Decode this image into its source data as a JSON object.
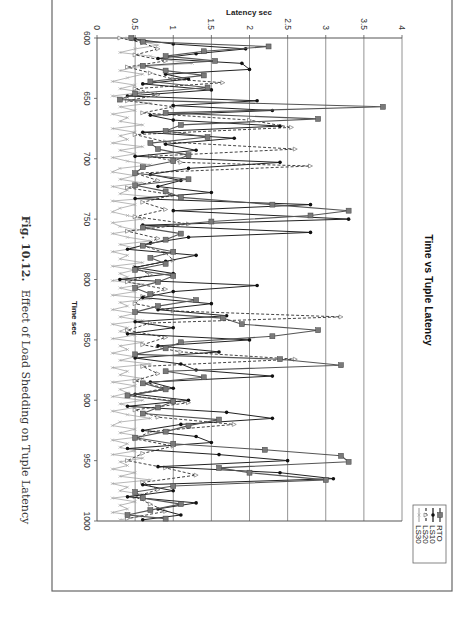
{
  "caption": {
    "label": "Fig. 10.12.",
    "text": "Effect of Load Shedding on Tuple Latency"
  },
  "chart_data": {
    "type": "line",
    "orientation": "rotated-90-clockwise",
    "title": "Time vs Tuple Latency",
    "xlabel": "Time sec",
    "ylabel": "Latency sec",
    "xlim": [
      600,
      1000
    ],
    "ylim": [
      0,
      4
    ],
    "x_ticks": [
      "600",
      "650",
      "700",
      "750",
      "800",
      "850",
      "900",
      "950",
      "1000"
    ],
    "y_ticks": [
      "0",
      "0.5",
      "1",
      "1.5",
      "2",
      "2.5",
      "3",
      "3.5",
      "4"
    ],
    "grid": "major gridlines on latency axis",
    "legend_position": "right (bottom-right when rotated)",
    "legend": [
      "RTO",
      "LS10",
      "LS20",
      "LS30"
    ],
    "series": [
      {
        "name": "RTO",
        "style": "solid, square markers",
        "color": "#555555",
        "x": [
          600,
          603,
          607,
          611,
          615,
          619,
          623,
          627,
          631,
          636,
          641,
          646,
          651,
          657,
          662,
          667,
          672,
          677,
          682,
          687,
          692,
          697,
          702,
          707,
          712,
          717,
          722,
          727,
          732,
          738,
          743,
          747,
          752,
          757,
          762,
          767,
          772,
          777,
          782,
          787,
          792,
          797,
          802,
          807,
          812,
          817,
          822,
          827,
          832,
          837,
          842,
          847,
          852,
          857,
          862,
          866,
          871,
          876,
          881,
          886,
          891,
          896,
          901,
          906,
          911,
          916,
          921,
          926,
          931,
          936,
          941,
          946,
          951,
          956,
          960,
          966,
          971,
          976,
          981,
          986,
          991,
          995,
          998
        ],
        "values": [
          0.45,
          0.6,
          2.25,
          1.4,
          0.9,
          1.55,
          0.6,
          0.9,
          1.4,
          0.7,
          1.45,
          0.5,
          0.3,
          3.75,
          0.9,
          2.9,
          1.1,
          0.9,
          1.45,
          0.7,
          0.8,
          1.2,
          1.0,
          0.6,
          0.5,
          1.2,
          0.5,
          0.9,
          1.1,
          2.3,
          3.3,
          2.8,
          1.5,
          0.6,
          1.1,
          0.9,
          0.6,
          1.0,
          0.7,
          0.9,
          0.5,
          1.0,
          0.8,
          0.5,
          0.7,
          1.3,
          0.8,
          0.5,
          1.65,
          1.9,
          2.9,
          2.3,
          1.1,
          0.9,
          0.5,
          2.4,
          3.2,
          0.9,
          1.4,
          0.6,
          0.9,
          0.4,
          1.0,
          0.8,
          0.6,
          1.6,
          1.2,
          0.9,
          0.5,
          1.0,
          2.2,
          3.2,
          3.3,
          1.6,
          2.0,
          3.0,
          1.0,
          0.5,
          0.6,
          1.1,
          0.7,
          0.4,
          0.9
        ],
        "peak": 3.75
      },
      {
        "name": "LS10",
        "style": "solid, diamond markers",
        "color": "#222222",
        "x": [
          601,
          605,
          609,
          613,
          617,
          621,
          626,
          630,
          634,
          638,
          643,
          648,
          652,
          656,
          660,
          664,
          668,
          673,
          678,
          683,
          688,
          693,
          698,
          703,
          708,
          713,
          718,
          723,
          728,
          733,
          738,
          743,
          750,
          755,
          761,
          765,
          770,
          775,
          780,
          785,
          790,
          795,
          800,
          805,
          810,
          815,
          820,
          825,
          830,
          835,
          840,
          845,
          850,
          855,
          860,
          865,
          870,
          875,
          880,
          885,
          890,
          895,
          900,
          905,
          910,
          915,
          920,
          925,
          930,
          935,
          940,
          945,
          950,
          955,
          960,
          965,
          970,
          975,
          980,
          985,
          990,
          995,
          999
        ],
        "values": [
          0.5,
          1.0,
          1.95,
          1.3,
          0.8,
          1.9,
          2.0,
          0.9,
          1.2,
          0.6,
          1.5,
          0.4,
          2.1,
          1.0,
          2.3,
          0.7,
          1.0,
          2.4,
          0.6,
          1.8,
          0.9,
          1.3,
          0.5,
          2.4,
          1.2,
          0.7,
          1.1,
          0.8,
          1.5,
          0.5,
          2.8,
          1.0,
          3.3,
          0.6,
          2.8,
          1.2,
          0.7,
          0.4,
          1.3,
          0.9,
          0.5,
          1.0,
          0.3,
          2.1,
          1.0,
          0.6,
          1.5,
          0.8,
          1.7,
          0.5,
          1.0,
          0.4,
          2.0,
          0.8,
          1.6,
          0.5,
          1.1,
          1.3,
          2.3,
          0.7,
          1.0,
          0.5,
          1.2,
          0.4,
          1.7,
          2.3,
          1.1,
          0.6,
          1.3,
          1.5,
          0.4,
          1.6,
          2.5,
          0.8,
          2.4,
          3.1,
          0.6,
          1.0,
          0.4,
          1.3,
          0.8,
          1.1,
          0.6
        ],
        "peak": 3.3
      },
      {
        "name": "LS20",
        "style": "dashed, open triangle markers",
        "color": "#444444",
        "x": [
          600,
          604,
          609,
          614,
          619,
          624,
          629,
          634,
          637,
          642,
          647,
          652,
          657,
          662,
          668,
          674,
          680,
          686,
          692,
          698,
          703,
          706,
          712,
          718,
          724,
          730,
          736,
          742,
          748,
          754,
          760,
          766,
          772,
          778,
          784,
          790,
          796,
          802,
          808,
          814,
          820,
          826,
          831,
          836,
          842,
          848,
          854,
          860,
          866,
          872,
          878,
          884,
          890,
          896,
          902,
          908,
          914,
          920,
          926,
          932,
          938,
          944,
          950,
          956,
          962,
          968,
          974,
          980,
          986,
          992,
          998
        ],
        "values": [
          0.3,
          0.6,
          0.8,
          0.5,
          0.9,
          0.4,
          0.7,
          1.0,
          1.65,
          0.5,
          0.8,
          0.4,
          1.0,
          0.6,
          2.0,
          2.55,
          0.5,
          0.9,
          2.6,
          0.7,
          1.1,
          2.8,
          0.5,
          0.8,
          0.4,
          1.0,
          0.6,
          0.9,
          0.5,
          1.2,
          0.4,
          0.8,
          0.6,
          0.9,
          1.0,
          0.5,
          0.7,
          0.4,
          0.9,
          0.6,
          0.5,
          1.0,
          3.2,
          0.7,
          0.4,
          0.9,
          0.6,
          1.1,
          2.6,
          0.6,
          0.8,
          0.5,
          0.9,
          0.4,
          1.2,
          0.5,
          0.8,
          1.8,
          0.7,
          0.5,
          1.0,
          0.6,
          0.4,
          0.9,
          1.3,
          0.6,
          0.8,
          0.5,
          0.7,
          0.9,
          0.4
        ],
        "peak": 3.2
      },
      {
        "name": "LS30",
        "style": "solid thin, x markers",
        "color": "#888888",
        "x": [
          600,
          603,
          606,
          609,
          612,
          615,
          618,
          621,
          624,
          627,
          630,
          633,
          636,
          639,
          642,
          645,
          648,
          651,
          654,
          657,
          660,
          663,
          666,
          669,
          672,
          675,
          678,
          681,
          684,
          687,
          690,
          693,
          696,
          699,
          702,
          705,
          708,
          711,
          714,
          717,
          720,
          723,
          726,
          729,
          732,
          735,
          738,
          741,
          744,
          747,
          750,
          753,
          756,
          759,
          762,
          765,
          768,
          771,
          774,
          777,
          780,
          783,
          786,
          789,
          792,
          795,
          798,
          801,
          804,
          807,
          810,
          813,
          816,
          819,
          822,
          825,
          828,
          831,
          834,
          837,
          840,
          843,
          846,
          849,
          852,
          855,
          858,
          861,
          864,
          867,
          870,
          873,
          876,
          879,
          882,
          885,
          888,
          891,
          894,
          897,
          900,
          903,
          906,
          909,
          912,
          915,
          918,
          921,
          924,
          927,
          930,
          933,
          936,
          939,
          942,
          945,
          948,
          951,
          954,
          957,
          960,
          963,
          966,
          969,
          972,
          975,
          978,
          981,
          984,
          987,
          990,
          993,
          996,
          999
        ],
        "values": [
          0.4,
          0.6,
          0.8,
          0.5,
          0.3,
          0.7,
          0.9,
          1.25,
          0.5,
          0.3,
          0.6,
          0.4,
          0.2,
          0.5,
          0.3,
          0.6,
          0.2,
          0.4,
          0.7,
          0.3,
          0.5,
          0.2,
          0.4,
          0.3,
          0.6,
          0.2,
          0.5,
          0.3,
          0.4,
          0.2,
          0.6,
          0.3,
          0.5,
          0.2,
          0.4,
          0.7,
          0.3,
          0.2,
          0.5,
          0.3,
          0.6,
          0.2,
          0.4,
          0.3,
          0.8,
          0.2,
          0.5,
          0.3,
          0.2,
          0.4,
          0.6,
          0.2,
          0.3,
          0.5,
          0.2,
          0.4,
          0.7,
          0.3,
          0.5,
          0.2,
          0.4,
          0.3,
          0.6,
          0.2,
          0.5,
          0.3,
          0.4,
          0.2,
          0.6,
          0.3,
          0.5,
          0.2,
          0.7,
          0.3,
          0.4,
          0.2,
          0.5,
          0.3,
          0.6,
          0.2,
          0.4,
          0.3,
          0.5,
          0.2,
          0.6,
          0.3,
          0.4,
          0.2,
          0.5,
          0.3,
          0.7,
          0.2,
          0.4,
          0.3,
          0.6,
          0.2,
          0.5,
          0.3,
          0.4,
          0.2,
          0.6,
          0.3,
          0.5,
          0.2,
          0.4,
          0.7,
          0.3,
          0.2,
          0.5,
          0.3,
          0.6,
          0.2,
          0.4,
          0.3,
          0.5,
          0.2,
          0.6,
          0.3,
          0.4,
          0.2,
          0.5,
          0.3,
          0.7,
          0.2,
          0.4,
          0.3,
          0.6,
          0.2,
          0.5,
          0.3,
          0.4,
          0.2,
          0.6,
          0.3
        ],
        "peak": 1.25
      }
    ]
  }
}
